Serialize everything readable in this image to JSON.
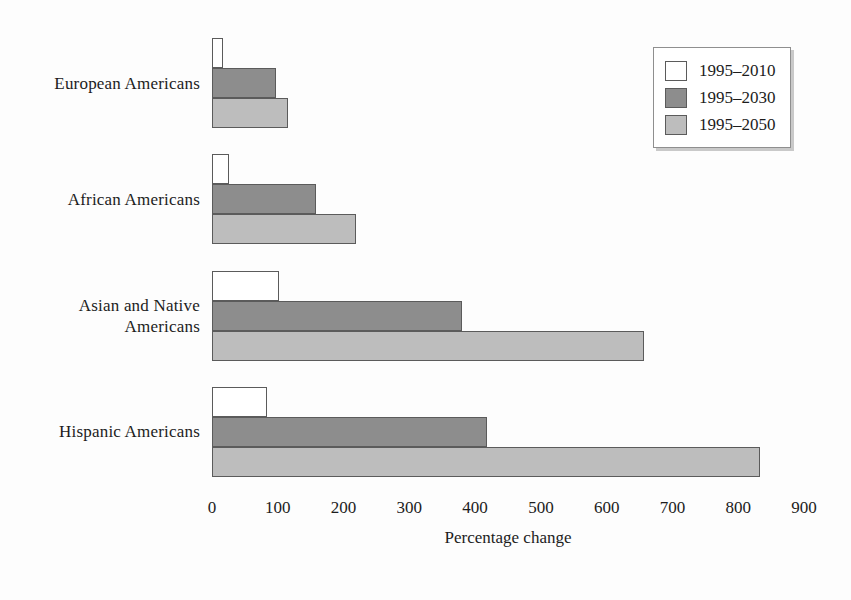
{
  "chart_data": {
    "type": "bar",
    "orientation": "horizontal",
    "title": "",
    "subtitle": "",
    "xlabel": "Percentage change",
    "ylabel": "",
    "xlim": [
      0,
      900
    ],
    "xticks": [
      0,
      100,
      200,
      300,
      400,
      500,
      600,
      700,
      800,
      900
    ],
    "xtick_labels": [
      "0",
      "100",
      "200",
      "300",
      "400",
      "500",
      "600",
      "700",
      "800",
      "900"
    ],
    "grid": false,
    "legend_position": "top-right",
    "categories": [
      "European Americans",
      "African Americans",
      "Asian and Native Americans",
      "Hispanic Americans"
    ],
    "category_label_lines": [
      [
        "European Americans"
      ],
      [
        "African Americans"
      ],
      [
        "Asian and Native",
        "Americans"
      ],
      [
        "Hispanic Americans"
      ]
    ],
    "series": [
      {
        "name": "1995–2010",
        "color": "#ffffff",
        "values": [
          17,
          26,
          102,
          84
        ]
      },
      {
        "name": "1995–2030",
        "color": "#8d8d8d",
        "values": [
          97,
          158,
          380,
          418
        ]
      },
      {
        "name": "1995–2050",
        "color": "#bdbdbd",
        "values": [
          116,
          219,
          657,
          833
        ]
      }
    ]
  },
  "legend": {
    "items": [
      {
        "label": "1995–2010"
      },
      {
        "label": "1995–2030"
      },
      {
        "label": "1995–2050"
      }
    ]
  },
  "colors": {
    "series_0": "#ffffff",
    "series_1": "#8d8d8d",
    "series_2": "#bdbdbd",
    "bar_outline": "#5b5b5b",
    "text": "#1c1c1c",
    "background": "#fdfdfd"
  }
}
